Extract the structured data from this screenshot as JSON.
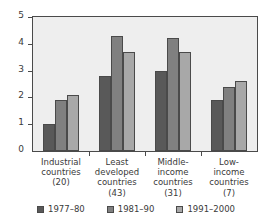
{
  "chart_data": {
    "type": "bar",
    "title": "",
    "subtitle": "",
    "xlabel": "",
    "ylabel": "",
    "ylim": [
      0,
      5
    ],
    "yticks": [
      0,
      1,
      2,
      3,
      4,
      5
    ],
    "grid": false,
    "legend_position": "bottom-center",
    "categories": [
      "Industrial countries (20)",
      "Least developed countries (43)",
      "Middle-income countries (31)",
      "Low-income countries (7)"
    ],
    "category_lines": [
      [
        "Industrial",
        "countries",
        "(20)"
      ],
      [
        "Least",
        "developed",
        "countries",
        "(43)"
      ],
      [
        "Middle-",
        "income",
        "countries",
        "(31)"
      ],
      [
        "Low-",
        "income",
        "countries",
        "(7)"
      ]
    ],
    "series": [
      {
        "name": "1977–80",
        "color": "#595959",
        "values": [
          1.0,
          2.8,
          3.0,
          1.9
        ]
      },
      {
        "name": "1981–90",
        "color": "#808080",
        "values": [
          1.9,
          4.3,
          4.2,
          2.4
        ]
      },
      {
        "name": "1991–2000",
        "color": "#a8a8a8",
        "values": [
          2.1,
          3.7,
          3.7,
          2.6
        ]
      }
    ]
  },
  "style": {
    "plot_background": "#eeeeee",
    "axis_color": "#4a4a4a",
    "text_color": "#3a3a3a",
    "page_background": "#ffffff"
  }
}
